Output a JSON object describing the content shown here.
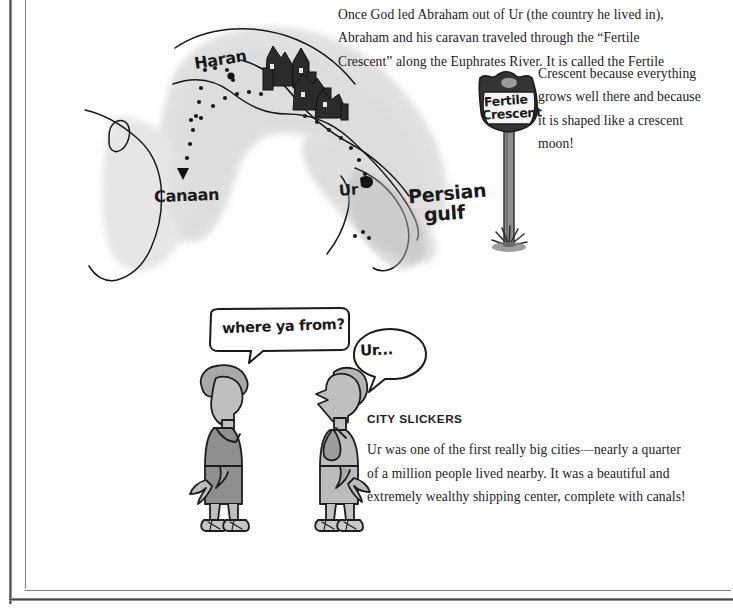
{
  "page": {
    "background": "#fefefe",
    "ink": "#231f20",
    "frame_color": "#4a4a4a"
  },
  "intro": {
    "lines": [
      "Once God led Abraham out of Ur (the country he lived in),",
      "Abraham and his caravan traveled through the “Fertile",
      "Crescent” along the Euphrates River. It is called the Fertile"
    ],
    "wrap_lines": [
      "Crescent because everything",
      "grows well there and because",
      "it is shaped like a crescent",
      "moon!"
    ]
  },
  "map": {
    "labels": {
      "haran": "Haran",
      "canaan": "Canaan",
      "ur": "Ur",
      "persian_gulf_line1": "Persian",
      "persian_gulf_line2": "gulf"
    },
    "land_fill": "#d8d8d8",
    "water_fill": "#ffffff",
    "coast_stroke": "#1a1a1a",
    "route_style": "dotted"
  },
  "sign": {
    "line1": "Fertile",
    "line2": "Crescent",
    "shield_fill": "#f3f3f3",
    "shield_border": "#2a2a2a"
  },
  "speech": {
    "left_bubble": "where ya from?",
    "right_bubble": "Ur..."
  },
  "figures": {
    "left_label": "man-left",
    "right_label": "man-right",
    "robe_fill": "#9b9b9b",
    "skin_fill": "#c9c9c9"
  },
  "city_slickers": {
    "heading": "CITY SLICKERS",
    "lines": [
      "Ur was one of the first really big cities—nearly a quarter",
      "of a million people lived nearby.  It was a beautiful and",
      "extremely wealthy shipping center, complete with canals!"
    ]
  }
}
